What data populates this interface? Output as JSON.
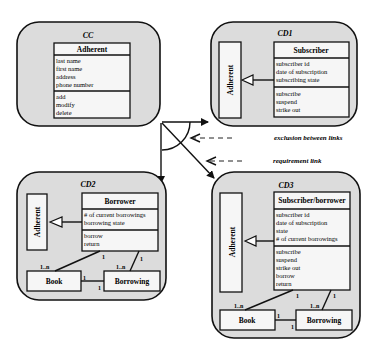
{
  "packages": {
    "cc": {
      "title": "CC",
      "class": {
        "name": "Adherent",
        "attributes": [
          "last name",
          "first name",
          "address",
          "phone number"
        ],
        "operations": [
          "add",
          "modify",
          "delete"
        ]
      }
    },
    "cd1": {
      "title": "CD1",
      "parent_label": "Adherent",
      "class": {
        "name": "Subscriber",
        "attributes": [
          "subscriber id",
          "date of subscription",
          "subscribing state"
        ],
        "operations": [
          "subscribe",
          "suspend",
          "strike out"
        ]
      }
    },
    "cd2": {
      "title": "CD2",
      "parent_label": "Adherent",
      "class": {
        "name": "Borrower",
        "attributes": [
          "# of current borrowings",
          "borrowing state"
        ],
        "operations": [
          "borrow",
          "return"
        ]
      },
      "book_label": "Book",
      "borrowing_label": "Borrowing",
      "multiplicities": {
        "borrower_book_top": "1",
        "borrower_book_bottom": "1..n",
        "borrower_borrowing_top": "1",
        "borrower_borrowing_bottom": "1..n",
        "book_borrowing_left": "1",
        "book_borrowing_right": "1"
      }
    },
    "cd3": {
      "title": "CD3",
      "parent_label": "Adherent",
      "class": {
        "name": "Subscriber/borrower",
        "attributes": [
          "subscriber id",
          "date of subscription",
          "state",
          "# of current borrowings"
        ],
        "operations": [
          "subscribe",
          "suspend",
          "strike out",
          "borrow",
          "return"
        ]
      },
      "book_label": "Book",
      "borrowing_label": "Borrowing",
      "multiplicities": {
        "borrower_book_top": "1",
        "borrower_book_bottom": "1..n",
        "borrower_borrowing_top": "1",
        "borrower_borrowing_bottom": "1..n",
        "book_borrowing_left": "1",
        "book_borrowing_right": "1"
      }
    }
  },
  "annotations": {
    "exclusion": "exclusion between links",
    "requirement": "requirement link"
  }
}
